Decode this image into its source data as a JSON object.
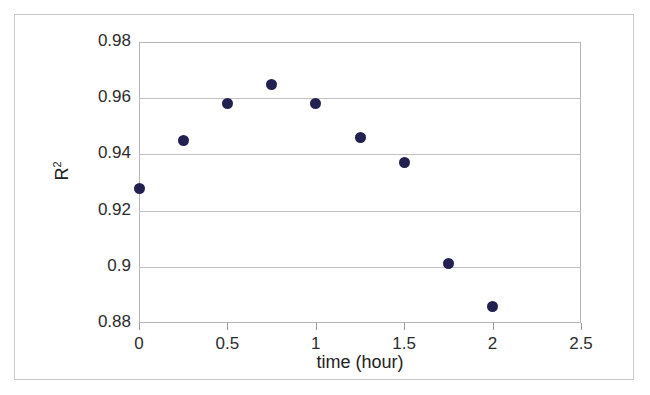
{
  "figure": {
    "background_color": "#ffffff",
    "frame_color": "#c9c9c9",
    "plot_border_color": "#b5b5b5",
    "gridline_color": "#c2c2c2",
    "marker_color": "#22214f"
  },
  "axis": {
    "y_label_text": "R",
    "y_label_exponent": "2",
    "x_label": "time (hour)"
  },
  "chart_data": {
    "type": "scatter",
    "title": "",
    "subtitle": "",
    "xlabel": "time (hour)",
    "ylabel": "R2",
    "xlim": [
      0,
      2.5
    ],
    "ylim": [
      0.88,
      0.98
    ],
    "xticks": [
      0,
      0.5,
      1,
      1.5,
      2,
      2.5
    ],
    "yticks": [
      0.88,
      0.9,
      0.92,
      0.94,
      0.96,
      0.98
    ],
    "xtick_labels": [
      "0",
      "0.5",
      "1",
      "1.5",
      "2",
      "2.5"
    ],
    "ytick_labels": [
      "0.88",
      "0.9",
      "0.92",
      "0.94",
      "0.96",
      "0.98"
    ],
    "grid": "horizontal",
    "legend": "none",
    "series": [
      {
        "name": "R2",
        "marker": "filled-circle",
        "color": "#22214f",
        "x": [
          0,
          0.25,
          0.5,
          0.75,
          1,
          1.25,
          1.5,
          1.75,
          2
        ],
        "y": [
          0.928,
          0.945,
          0.958,
          0.965,
          0.958,
          0.946,
          0.937,
          0.901,
          0.886
        ]
      }
    ]
  }
}
